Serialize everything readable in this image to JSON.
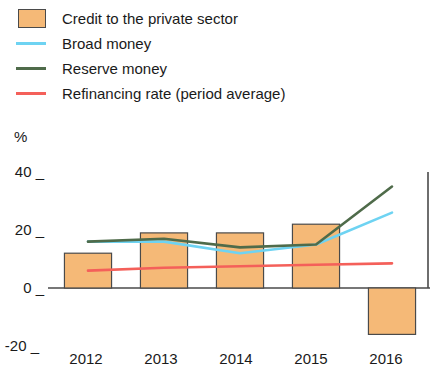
{
  "chart_data": {
    "type": "bar",
    "title": "",
    "xlabel": "",
    "ylabel": "%",
    "ylim": [
      -20,
      40
    ],
    "yticks": [
      -20,
      0,
      20,
      40
    ],
    "ytick_labels": [
      "-20 _",
      "0 _",
      "20 _",
      "40 _"
    ],
    "grid": false,
    "legend_position": "top-left",
    "categories": [
      "2012",
      "2013",
      "2014",
      "2015",
      "2016"
    ],
    "series": [
      {
        "name": "Credit to the private sector",
        "type": "bar",
        "color": "#f5b977",
        "edge_color": "#4a4a4a",
        "values": [
          12,
          19,
          19,
          22,
          -16
        ]
      },
      {
        "name": "Broad money",
        "type": "line",
        "color": "#6ed3f2",
        "values": [
          16,
          16,
          12,
          15,
          26
        ]
      },
      {
        "name": "Reserve money",
        "type": "line",
        "color": "#4f6b4a",
        "values": [
          16,
          17,
          14,
          15,
          35
        ]
      },
      {
        "name": "Refinancing rate (period average)",
        "type": "line",
        "color": "#f4605a",
        "values": [
          6,
          7,
          7.5,
          8,
          8.5
        ]
      }
    ]
  },
  "legend": {
    "items": [
      {
        "label": "Credit to the private sector",
        "marker": "box",
        "color": "#f5b977"
      },
      {
        "label": "Broad money",
        "marker": "line",
        "color": "#6ed3f2"
      },
      {
        "label": "Reserve money",
        "marker": "line",
        "color": "#4f6b4a"
      },
      {
        "label": "Refinancing rate (period average)",
        "marker": "line",
        "color": "#f4605a"
      }
    ]
  },
  "axis": {
    "unit_label": "%",
    "y_labels": [
      "40 _",
      "20 _",
      "0 _",
      "-20 _"
    ],
    "x_labels": [
      "2012",
      "2013",
      "2014",
      "2015",
      "2016"
    ]
  }
}
